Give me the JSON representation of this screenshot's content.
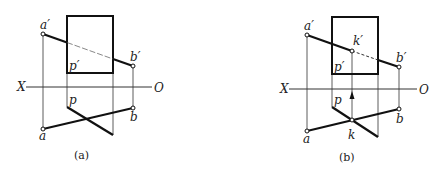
{
  "panels": [
    {
      "caption": "(a)",
      "labels": {
        "a_prime": "a′",
        "b_prime": "b′",
        "p_prime": "p′",
        "a": "a",
        "b": "b",
        "p": "p",
        "x": "X",
        "o": "O"
      }
    },
    {
      "caption": "(b)",
      "labels": {
        "a_prime": "a′",
        "b_prime": "b′",
        "k_prime": "k′",
        "p_prime": "p′",
        "a": "a",
        "b": "b",
        "k": "k",
        "p": "p",
        "x": "X",
        "o": "O"
      }
    }
  ],
  "colors": {
    "line": "#222222",
    "background": "#ffffff"
  }
}
